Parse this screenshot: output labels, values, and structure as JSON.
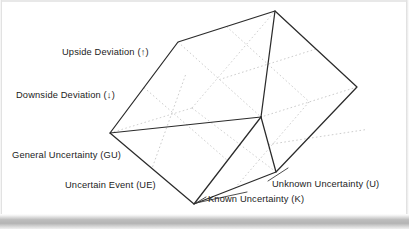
{
  "figure": {
    "type": "3d-cube-diagram",
    "background_color": "#ffffff",
    "line_color": "#2b2b2b",
    "hidden_line_color": "#b9b9b9",
    "axes": [
      {
        "id": "vertical",
        "labels": [
          {
            "id": "upside-deviation",
            "text": "Upside Deviation (↑)",
            "symbol": "↑"
          },
          {
            "id": "downside-deviation",
            "text": "Downside Deviation (↓)",
            "symbol": "↓"
          }
        ]
      },
      {
        "id": "left-depth",
        "labels": [
          {
            "id": "general-uncertainty",
            "text": "General Uncertainty (GU)",
            "abbr": "GU"
          },
          {
            "id": "uncertain-event",
            "text": "Uncertain Event (UE)",
            "abbr": "UE"
          }
        ]
      },
      {
        "id": "right-width",
        "labels": [
          {
            "id": "known-uncertainty",
            "text": "Known Uncertainty (K)",
            "abbr": "K"
          },
          {
            "id": "unknown-uncertainty",
            "text": "Unknown Uncertainty (U)",
            "abbr": "U"
          }
        ]
      }
    ],
    "labels": {
      "upside": "Upside Deviation (↑)",
      "downside": "Downside Deviation (↓)",
      "general_uncertainty": "General Uncertainty (GU)",
      "uncertain_event": "Uncertain Event (UE)",
      "known_uncertainty": "Known Uncertainty (K)",
      "unknown_uncertainty": "Unknown Uncertainty (U)"
    },
    "geometry": {
      "vertices": {
        "top": [
          275,
          11
        ],
        "left_top": [
          178,
          42
        ],
        "right": [
          357,
          87
        ],
        "front_center": [
          261,
          117
        ],
        "left": [
          110,
          133
        ],
        "bottom_right": [
          276,
          172
        ],
        "bottom": [
          194,
          204
        ]
      },
      "subdivisions": 2,
      "faces": [
        "top",
        "left",
        "right"
      ]
    }
  }
}
